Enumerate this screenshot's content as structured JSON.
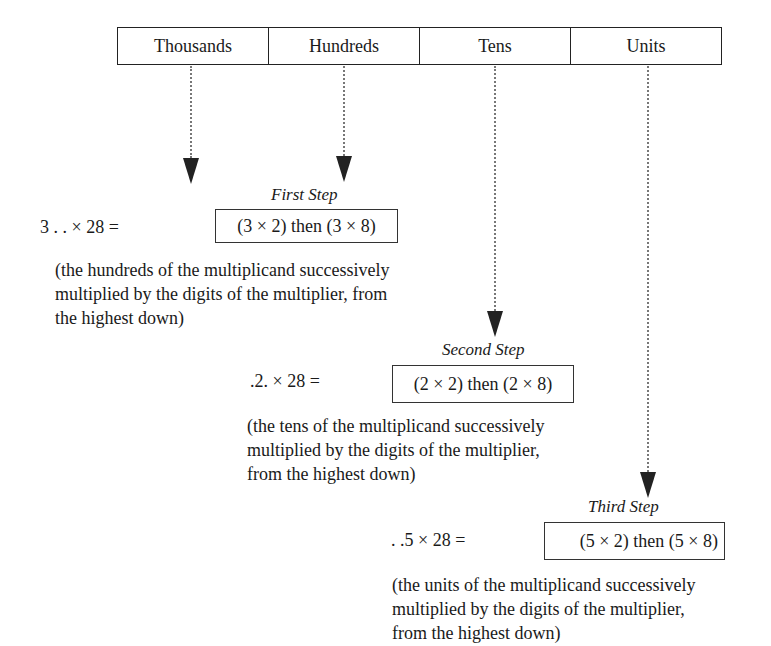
{
  "columns": [
    {
      "label": "Thousands"
    },
    {
      "label": "Hundreds"
    },
    {
      "label": "Tens"
    },
    {
      "label": "Units"
    }
  ],
  "steps": [
    {
      "title": "First Step",
      "expression": "3 . . × 28 =",
      "operation": "(3 × 2) then (3 × 8)",
      "description_lines": [
        "(the hundreds of the multiplicand successively",
        "multiplied by the digits of the multiplier, from",
        "the highest down)"
      ]
    },
    {
      "title": "Second Step",
      "expression": ".2. × 28 =",
      "operation": "(2 × 2) then (2 × 8)",
      "description_lines": [
        "(the tens of the multiplicand successively",
        "multiplied by the digits of the multiplier,",
        "from the highest down)"
      ]
    },
    {
      "title": "Third Step",
      "expression": ". .5 × 28 =",
      "operation": "(5 × 2) then (5 × 8)",
      "description_lines": [
        "(the units of the multiplicand successively",
        "multiplied by the digits of the multiplier,",
        "from the highest down)"
      ]
    }
  ]
}
